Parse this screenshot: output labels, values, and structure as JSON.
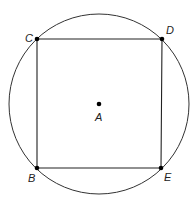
{
  "diagram": {
    "circle": {
      "cx": 99,
      "cy": 104,
      "r": 90,
      "stroke": "#333333"
    },
    "square": {
      "points": "37,39 162,39 161,168 37,168",
      "stroke": "#222222"
    },
    "points": [
      {
        "id": "C",
        "x": 37,
        "y": 39,
        "label": "C",
        "lx": 25,
        "ly": 42
      },
      {
        "id": "D",
        "x": 162,
        "y": 39,
        "label": "D",
        "lx": 166,
        "ly": 34
      },
      {
        "id": "B",
        "x": 37,
        "y": 168,
        "label": "B",
        "lx": 28,
        "ly": 182
      },
      {
        "id": "E",
        "x": 161,
        "y": 168,
        "label": "E",
        "lx": 164,
        "ly": 181
      },
      {
        "id": "A",
        "x": 99,
        "y": 104,
        "label": "A",
        "lx": 95,
        "ly": 121
      }
    ]
  }
}
